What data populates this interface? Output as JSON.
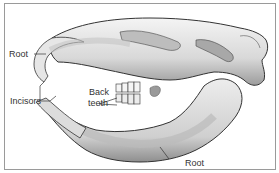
{
  "figure": {
    "labels": {
      "root_upper": "Root",
      "incisors": "Incisors",
      "back_teeth_line1": "Back",
      "back_teeth_line2": "teeth",
      "root_lower": "Root"
    }
  },
  "colors": {
    "border": "#9a9a9a",
    "outline": "#333333",
    "bone_light": "#f2f2f2",
    "bone_mid": "#cfcfcf",
    "bone_dark": "#8a8a8a"
  }
}
